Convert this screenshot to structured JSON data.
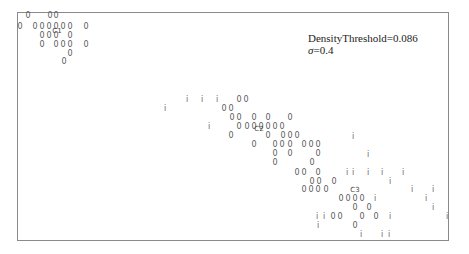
{
  "chart_data": {
    "type": "scatter",
    "title": "",
    "xlabel": "",
    "ylabel": "",
    "grid": false,
    "legend": null,
    "annotation": {
      "line1": "DensityThreshold=0.086",
      "line2_symbol": "σ",
      "line2_value": "=0.4"
    },
    "marker_glyphs": {
      "cluster_member": "0",
      "noise": "i"
    },
    "centroids": [
      {
        "label": "C1",
        "x": 57,
        "y": 31
      },
      {
        "label": "C2",
        "x": 259,
        "y": 129
      },
      {
        "label": "C3",
        "x": 355,
        "y": 190
      }
    ],
    "series": [
      {
        "name": "cluster_points",
        "glyph": "0",
        "points": [
          [
            28,
            16
          ],
          [
            50,
            16
          ],
          [
            56,
            16
          ],
          [
            20,
            27
          ],
          [
            35,
            27
          ],
          [
            42,
            27
          ],
          [
            49,
            27
          ],
          [
            56,
            27
          ],
          [
            63,
            27
          ],
          [
            70,
            27
          ],
          [
            86,
            27
          ],
          [
            42,
            36
          ],
          [
            49,
            36
          ],
          [
            56,
            36
          ],
          [
            70,
            36
          ],
          [
            42,
            45
          ],
          [
            56,
            45
          ],
          [
            63,
            45
          ],
          [
            70,
            45
          ],
          [
            86,
            45
          ],
          [
            70,
            54
          ],
          [
            64,
            62
          ],
          [
            239,
            100
          ],
          [
            246,
            100
          ],
          [
            224,
            109
          ],
          [
            231,
            109
          ],
          [
            232,
            118
          ],
          [
            239,
            118
          ],
          [
            254,
            118
          ],
          [
            268,
            118
          ],
          [
            290,
            118
          ],
          [
            239,
            127
          ],
          [
            247,
            127
          ],
          [
            254,
            127
          ],
          [
            261,
            127
          ],
          [
            268,
            127
          ],
          [
            275,
            127
          ],
          [
            282,
            127
          ],
          [
            231,
            136
          ],
          [
            268,
            136
          ],
          [
            283,
            136
          ],
          [
            290,
            136
          ],
          [
            297,
            136
          ],
          [
            254,
            145
          ],
          [
            275,
            145
          ],
          [
            282,
            145
          ],
          [
            290,
            145
          ],
          [
            304,
            145
          ],
          [
            311,
            145
          ],
          [
            318,
            145
          ],
          [
            275,
            154
          ],
          [
            290,
            154
          ],
          [
            318,
            154
          ],
          [
            275,
            163
          ],
          [
            312,
            163
          ],
          [
            297,
            173
          ],
          [
            304,
            173
          ],
          [
            318,
            173
          ],
          [
            312,
            182
          ],
          [
            319,
            182
          ],
          [
            334,
            182
          ],
          [
            304,
            190
          ],
          [
            311,
            190
          ],
          [
            318,
            190
          ],
          [
            326,
            190
          ],
          [
            341,
            199
          ],
          [
            348,
            199
          ],
          [
            355,
            199
          ],
          [
            362,
            199
          ],
          [
            355,
            208
          ],
          [
            369,
            208
          ],
          [
            333,
            217
          ],
          [
            340,
            217
          ],
          [
            362,
            217
          ],
          [
            376,
            217
          ],
          [
            355,
            226
          ]
        ]
      },
      {
        "name": "noise_points",
        "glyph": "i",
        "points": [
          [
            187,
            100
          ],
          [
            202,
            100
          ],
          [
            217,
            100
          ],
          [
            165,
            109
          ],
          [
            209,
            127
          ],
          [
            353,
            137
          ],
          [
            368,
            155
          ],
          [
            347,
            173
          ],
          [
            353,
            173
          ],
          [
            368,
            173
          ],
          [
            382,
            173
          ],
          [
            403,
            173
          ],
          [
            390,
            182
          ],
          [
            412,
            190
          ],
          [
            433,
            190
          ],
          [
            375,
            199
          ],
          [
            426,
            199
          ],
          [
            433,
            208
          ],
          [
            317,
            217
          ],
          [
            324,
            217
          ],
          [
            390,
            217
          ],
          [
            447,
            217
          ],
          [
            318,
            226
          ],
          [
            361,
            235
          ],
          [
            382,
            235
          ],
          [
            389,
            235
          ]
        ]
      }
    ]
  }
}
